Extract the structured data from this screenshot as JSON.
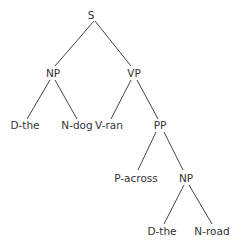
{
  "diagram": {
    "type": "syntax-tree",
    "nodes": {
      "s": "S",
      "np1": "NP",
      "vp": "VP",
      "d1": "D-the",
      "n1": "N-dog",
      "v": "V-ran",
      "pp": "PP",
      "p": "P-across",
      "np2": "NP",
      "d2": "D-the",
      "n2": "N-road"
    },
    "edges": [
      [
        "S",
        "NP"
      ],
      [
        "S",
        "VP"
      ],
      [
        "NP",
        "D-the"
      ],
      [
        "NP",
        "N-dog"
      ],
      [
        "VP",
        "V-ran"
      ],
      [
        "VP",
        "PP"
      ],
      [
        "PP",
        "P-across"
      ],
      [
        "PP",
        "NP"
      ],
      [
        "NP",
        "D-the"
      ],
      [
        "NP",
        "N-road"
      ]
    ],
    "colors": {
      "text": "#333333",
      "line": "#444444",
      "background": "#ffffff"
    }
  }
}
